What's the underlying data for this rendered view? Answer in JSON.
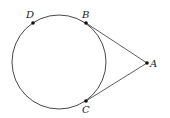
{
  "diagram": {
    "type": "geometry",
    "stroke_color": "#333333",
    "circle": {
      "cx": 59,
      "cy": 62,
      "r": 47
    },
    "points": [
      {
        "name": "D",
        "x": 33,
        "y": 23,
        "label_x": 26,
        "label_y": 18
      },
      {
        "name": "B",
        "x": 86,
        "y": 23,
        "label_x": 82,
        "label_y": 18
      },
      {
        "name": "A",
        "x": 147,
        "y": 63,
        "label_x": 150,
        "label_y": 67
      },
      {
        "name": "C",
        "x": 86,
        "y": 101,
        "label_x": 82,
        "label_y": 113
      }
    ],
    "segments": [
      {
        "from": "B",
        "to": "A"
      },
      {
        "from": "C",
        "to": "A"
      }
    ]
  }
}
